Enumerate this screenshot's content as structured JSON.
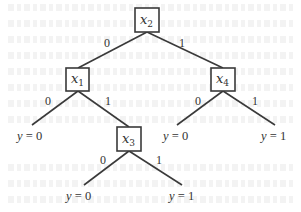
{
  "diagram": {
    "type": "decision-tree",
    "nodes": {
      "x2": {
        "var": "x",
        "sub": "2"
      },
      "x1": {
        "var": "x",
        "sub": "1"
      },
      "x4": {
        "var": "x",
        "sub": "4"
      },
      "x3": {
        "var": "x",
        "sub": "3"
      }
    },
    "edges": [
      {
        "from": "x2",
        "to": "x1",
        "label": "0"
      },
      {
        "from": "x2",
        "to": "x4",
        "label": "1"
      },
      {
        "from": "x1",
        "to": "leaf_a",
        "label": "0"
      },
      {
        "from": "x1",
        "to": "x3",
        "label": "1"
      },
      {
        "from": "x4",
        "to": "leaf_c",
        "label": "0"
      },
      {
        "from": "x4",
        "to": "leaf_d",
        "label": "1"
      },
      {
        "from": "x3",
        "to": "leaf_e",
        "label": "0"
      },
      {
        "from": "x3",
        "to": "leaf_f",
        "label": "1"
      }
    ],
    "leaves": {
      "leaf_a": {
        "var": "y",
        "eq": " = ",
        "value": "0"
      },
      "leaf_c": {
        "var": "y",
        "eq": " = ",
        "value": "0"
      },
      "leaf_d": {
        "var": "y",
        "eq": " = ",
        "value": "1"
      },
      "leaf_e": {
        "var": "y",
        "eq": " = ",
        "value": "0"
      },
      "leaf_f": {
        "var": "y",
        "eq": " = ",
        "value": "1"
      }
    }
  }
}
